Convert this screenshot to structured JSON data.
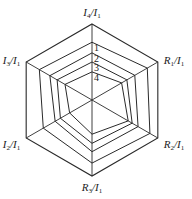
{
  "chart_data": {
    "type": "radar",
    "title": "",
    "axes": [
      {
        "label": "I4/I1",
        "base": "I",
        "sub": "4",
        "den_base": "I",
        "den_sub": "1"
      },
      {
        "label": "R1/I1",
        "base": "R",
        "sub": "1",
        "den_base": "I",
        "den_sub": "1"
      },
      {
        "label": "R2/I1",
        "base": "R",
        "sub": "2",
        "den_base": "I",
        "den_sub": "1"
      },
      {
        "label": "R3/I1",
        "base": "R",
        "sub": "3",
        "den_base": "I",
        "den_sub": "1"
      },
      {
        "label": "I2/I1",
        "base": "I",
        "sub": "2",
        "den_base": "I",
        "den_sub": "1"
      },
      {
        "label": "I3/I1",
        "base": "I",
        "sub": "3",
        "den_base": "I",
        "den_sub": "1"
      }
    ],
    "range": [
      0,
      1
    ],
    "grid": "outer hexagon frame only",
    "series": [
      {
        "name": "1",
        "values": [
          0.76,
          0.84,
          0.88,
          0.83,
          0.74,
          0.8
        ]
      },
      {
        "name": "2",
        "values": [
          0.62,
          0.65,
          0.7,
          0.68,
          0.56,
          0.64
        ]
      },
      {
        "name": "3",
        "values": [
          0.5,
          0.53,
          0.61,
          0.57,
          0.48,
          0.53
        ]
      },
      {
        "name": "4",
        "values": [
          0.37,
          0.45,
          0.55,
          0.45,
          0.34,
          0.41
        ]
      }
    ],
    "legend": "series numbers labeled along the top axis"
  },
  "style": {
    "line_color": "#2a2a2a",
    "background": "#ffffff"
  }
}
